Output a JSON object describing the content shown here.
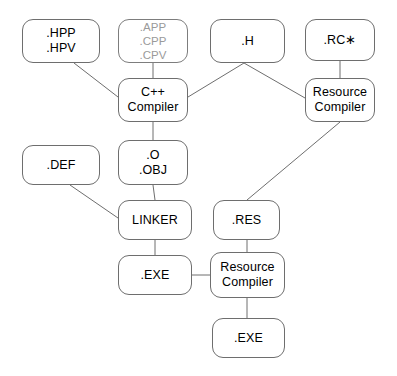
{
  "diagram": {
    "canvas": {
      "width": 397,
      "height": 376,
      "background": "#ffffff"
    },
    "style": {
      "node_border": "#6e6e6e",
      "node_fill": "#ffffff",
      "text_color": "#000000",
      "dim_text_color": "#9a9a9a",
      "edge_color": "#6e6e6e"
    },
    "nodes": [
      {
        "id": "hpp",
        "label": ".HPP\n.HPV",
        "lines": [
          ".HPP",
          ".HPV"
        ],
        "kind": "file",
        "dim": false,
        "x": 22,
        "y": 19,
        "w": 78,
        "h": 44
      },
      {
        "id": "sources",
        "label": ".APP\n.CPP\n.CPV",
        "lines": [
          ".APP",
          ".CPP",
          ".CPV"
        ],
        "kind": "file",
        "dim": true,
        "x": 118,
        "y": 19,
        "w": 70,
        "h": 44
      },
      {
        "id": "h",
        "label": ".H",
        "lines": [
          ".H"
        ],
        "kind": "file",
        "dim": false,
        "x": 210,
        "y": 19,
        "w": 75,
        "h": 44
      },
      {
        "id": "rc",
        "label": ".RC*",
        "lines": [
          ".RC∗"
        ],
        "kind": "file",
        "dim": false,
        "x": 305,
        "y": 19,
        "w": 70,
        "h": 42
      },
      {
        "id": "cppcompiler",
        "label": "C++ Compiler",
        "lines": [
          "C++",
          "Compiler"
        ],
        "kind": "tool",
        "dim": false,
        "x": 118,
        "y": 78,
        "w": 70,
        "h": 44
      },
      {
        "id": "rescompiler_top",
        "label": "Resource Compiler",
        "lines": [
          "Resource",
          "Compiler"
        ],
        "kind": "tool",
        "dim": false,
        "x": 305,
        "y": 78,
        "w": 70,
        "h": 44
      },
      {
        "id": "def",
        "label": ".DEF",
        "lines": [
          ".DEF"
        ],
        "kind": "file",
        "dim": false,
        "x": 22,
        "y": 145,
        "w": 78,
        "h": 40
      },
      {
        "id": "obj",
        "label": ".O\n.OBJ",
        "lines": [
          ".O",
          ".OBJ"
        ],
        "kind": "file",
        "dim": false,
        "x": 118,
        "y": 140,
        "w": 70,
        "h": 45
      },
      {
        "id": "linker",
        "label": "LINKER",
        "lines": [
          "LINKER"
        ],
        "kind": "tool",
        "dim": false,
        "x": 118,
        "y": 200,
        "w": 74,
        "h": 40
      },
      {
        "id": "res",
        "label": ".RES",
        "lines": [
          ".RES"
        ],
        "kind": "file",
        "dim": false,
        "x": 213,
        "y": 200,
        "w": 67,
        "h": 40
      },
      {
        "id": "exe_mid",
        "label": ".EXE",
        "lines": [
          ".EXE"
        ],
        "kind": "file",
        "dim": false,
        "x": 118,
        "y": 255,
        "w": 74,
        "h": 40
      },
      {
        "id": "rescompiler_bottom",
        "label": "Resource Compiler",
        "lines": [
          "Resource",
          "Compiler"
        ],
        "kind": "tool",
        "dim": false,
        "x": 210,
        "y": 252,
        "w": 75,
        "h": 46
      },
      {
        "id": "exe_final",
        "label": ".EXE",
        "lines": [
          ".EXE"
        ],
        "kind": "file",
        "dim": false,
        "x": 212,
        "y": 318,
        "w": 73,
        "h": 40
      }
    ],
    "edges": [
      {
        "id": "e-hpp-cpp",
        "from": "hpp",
        "to": "cppcompiler",
        "x1": 74,
        "y1": 63,
        "x2": 118,
        "y2": 97
      },
      {
        "id": "e-src-cpp",
        "from": "sources",
        "to": "cppcompiler",
        "x1": 153,
        "y1": 63,
        "x2": 153,
        "y2": 78
      },
      {
        "id": "e-h-cpp",
        "from": "h",
        "to": "cppcompiler",
        "x1": 244,
        "y1": 63,
        "x2": 188,
        "y2": 97
      },
      {
        "id": "e-h-rescomp",
        "from": "h",
        "to": "rescompiler_top",
        "x1": 244,
        "y1": 63,
        "x2": 305,
        "y2": 98
      },
      {
        "id": "e-rc-rescomp",
        "from": "rc",
        "to": "rescompiler_top",
        "x1": 340,
        "y1": 61,
        "x2": 340,
        "y2": 78
      },
      {
        "id": "e-cpp-obj",
        "from": "cppcompiler",
        "to": "obj",
        "x1": 153,
        "y1": 122,
        "x2": 153,
        "y2": 140
      },
      {
        "id": "e-obj-linker",
        "from": "obj",
        "to": "linker",
        "x1": 153,
        "y1": 185,
        "x2": 155,
        "y2": 200
      },
      {
        "id": "e-def-linker",
        "from": "def",
        "to": "linker",
        "x1": 70,
        "y1": 185,
        "x2": 118,
        "y2": 218
      },
      {
        "id": "e-rescomp-res",
        "from": "rescompiler_top",
        "to": "res",
        "x1": 340,
        "y1": 122,
        "x2": 247,
        "y2": 200
      },
      {
        "id": "e-linker-exe",
        "from": "linker",
        "to": "exe_mid",
        "x1": 155,
        "y1": 240,
        "x2": 155,
        "y2": 255
      },
      {
        "id": "e-res-rescomp2",
        "from": "res",
        "to": "rescompiler_bottom",
        "x1": 247,
        "y1": 240,
        "x2": 247,
        "y2": 252
      },
      {
        "id": "e-exe-rescomp2",
        "from": "exe_mid",
        "to": "rescompiler_bottom",
        "x1": 192,
        "y1": 275,
        "x2": 210,
        "y2": 275
      },
      {
        "id": "e-rescomp2-exe",
        "from": "rescompiler_bottom",
        "to": "exe_final",
        "x1": 247,
        "y1": 298,
        "x2": 247,
        "y2": 318
      }
    ]
  }
}
